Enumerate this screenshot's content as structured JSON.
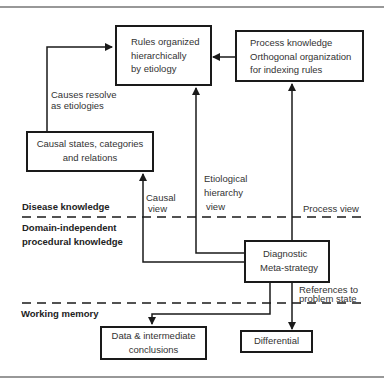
{
  "diagram": {
    "type": "knowledge-architecture flow diagram",
    "boxes": {
      "rules": {
        "lines": [
          "Rules organized",
          "hierarchically",
          "by etiology"
        ]
      },
      "process": {
        "lines": [
          "Process knowledge",
          "Orthogonal organization",
          "for indexing rules"
        ]
      },
      "causal": {
        "lines": [
          "Causal states, categories",
          "and relations"
        ]
      },
      "meta": {
        "lines": [
          "Diagnostic",
          "Meta-strategy"
        ]
      },
      "data": {
        "lines": [
          "Data & intermediate",
          "conclusions"
        ]
      },
      "differential": {
        "lines": [
          "Differential"
        ]
      }
    },
    "edge_labels": {
      "causes_resolve": [
        "Causes resolve",
        "as etiologies"
      ],
      "etiological": [
        "Etiological",
        "hierarchy",
        "view"
      ],
      "causal_view": [
        "Causal",
        "view"
      ],
      "process_view": "Process view",
      "references": [
        "References to",
        "problem state"
      ]
    },
    "layers": {
      "disease": "Disease knowledge",
      "procedural": [
        "Domain-independent",
        "procedural knowledge"
      ],
      "working": "Working memory"
    },
    "edges": [
      {
        "from": "causal",
        "to": "rules",
        "label": "Causes resolve as etiologies"
      },
      {
        "from": "process",
        "to": "rules",
        "label": ""
      },
      {
        "from": "meta",
        "to": "rules",
        "label": "Etiological hierarchy view"
      },
      {
        "from": "meta",
        "to": "causal",
        "label": "Causal view"
      },
      {
        "from": "meta",
        "to": "process",
        "label": "Process view"
      },
      {
        "from": "meta",
        "to": "data",
        "label": ""
      },
      {
        "from": "meta",
        "to": "differential",
        "label": "References to problem state"
      }
    ],
    "colors": {
      "line": "#1a1a1a",
      "text": "#333333",
      "background": "#ffffff"
    }
  }
}
